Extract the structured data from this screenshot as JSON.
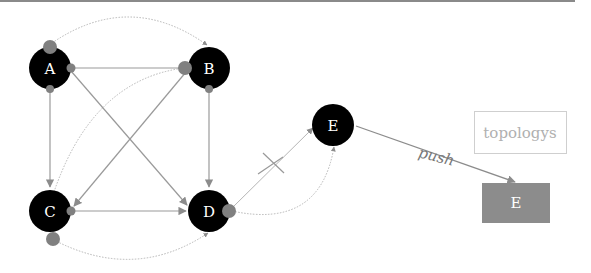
{
  "diagram": {
    "top_rule_color": "#8a8a8a",
    "colors": {
      "node_fill": "#000000",
      "node_text": "#ffffff",
      "edge": "#9a9a9a",
      "port": "#808080",
      "dotted_edge": "#b5b5b5",
      "target_box": "#8c8c8c",
      "legend_border": "#cfcfcf",
      "legend_text": "#b0b0b0"
    },
    "nodes": [
      {
        "id": "A",
        "label": "A",
        "cx": 50,
        "cy": 68
      },
      {
        "id": "B",
        "label": "B",
        "cx": 209,
        "cy": 68
      },
      {
        "id": "C",
        "label": "C",
        "cx": 50,
        "cy": 211
      },
      {
        "id": "D",
        "label": "D",
        "cx": 209,
        "cy": 211
      },
      {
        "id": "E",
        "label": "E",
        "cx": 333,
        "cy": 125
      }
    ],
    "edges": [
      {
        "from": "A",
        "to": "B",
        "style": "solid"
      },
      {
        "from": "A",
        "to": "C",
        "style": "solid"
      },
      {
        "from": "A",
        "to": "D",
        "style": "solid"
      },
      {
        "from": "B",
        "to": "C",
        "style": "solid"
      },
      {
        "from": "B",
        "to": "D",
        "style": "solid"
      },
      {
        "from": "C",
        "to": "D",
        "style": "solid"
      },
      {
        "from": "A",
        "to": "B",
        "style": "dotted-arc"
      },
      {
        "from": "B",
        "to": "C",
        "style": "dotted-arc"
      },
      {
        "from": "C",
        "to": "D",
        "style": "dotted-arc"
      },
      {
        "from": "D",
        "to": "E",
        "style": "solid",
        "blocked": true
      },
      {
        "from": "D",
        "to": "E",
        "style": "dotted-arc"
      },
      {
        "from": "E",
        "to": "E-box",
        "style": "solid",
        "label": "push"
      }
    ],
    "push_label": "push",
    "target_box": {
      "label": "E"
    },
    "legend": {
      "label": "topologys"
    }
  }
}
